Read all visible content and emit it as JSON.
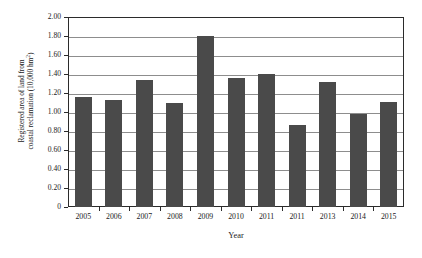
{
  "chart_data": {
    "type": "bar",
    "title": "",
    "xlabel": "Year",
    "ylabel_lines": [
      "Registered area of land from",
      "coastal reclamation (10,000 hm"
    ],
    "ylabel_superscript": "2",
    "ylabel_tail": ")",
    "ylabel": "Registered area of land from coastal reclamation (10,000 hm2)",
    "categories": [
      "2005",
      "2006",
      "2007",
      "2008",
      "2009",
      "2010",
      "2011",
      "2011",
      "2013",
      "2014",
      "2015"
    ],
    "values": [
      1.16,
      1.13,
      1.34,
      1.1,
      1.8,
      1.36,
      1.4,
      0.86,
      1.32,
      0.98,
      1.11
    ],
    "series": [
      {
        "name": "Registered area of land from coastal reclamation",
        "values": [
          1.16,
          1.13,
          1.34,
          1.1,
          1.8,
          1.36,
          1.4,
          0.86,
          1.32,
          0.98,
          1.11
        ]
      }
    ],
    "ylim": [
      0,
      2.0
    ],
    "ytick_step": 0.2,
    "ytick_labels": [
      "2.00",
      "1.80",
      "1.60",
      "1.40",
      "1.20",
      "1.00",
      "0.80",
      "0.60",
      "0.40",
      "0.20",
      "0"
    ],
    "ytick_values": [
      2.0,
      1.8,
      1.6,
      1.4,
      1.2,
      1.0,
      0.8,
      0.6,
      0.4,
      0.2,
      0
    ],
    "grid": "horizontal",
    "legend": "none",
    "bar_color": "#4a4a4a",
    "grid_color": "#8d8d8d",
    "axis_color": "#2b2b2b",
    "background_color": "#ffffff"
  }
}
